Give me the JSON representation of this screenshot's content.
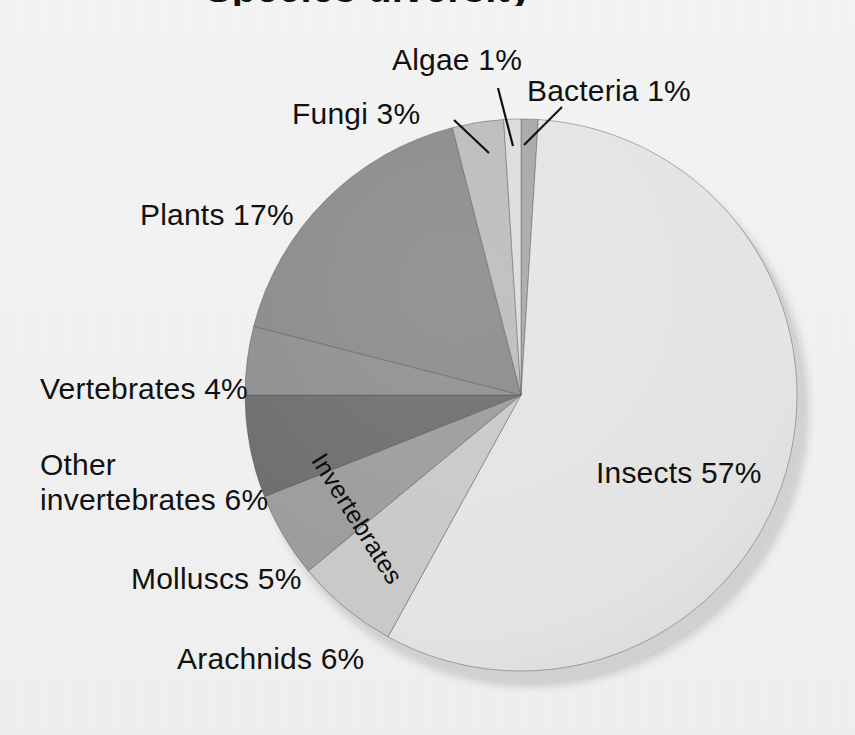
{
  "figure": {
    "kind": "pie-chart-scan",
    "background_color": "#f2f2f2",
    "text_color": "#111111",
    "cropped_title": "Species diversity",
    "center_x": 521,
    "center_y": 395,
    "radius": 276,
    "inner_bracket_label": "Invertebrates"
  },
  "chart_data": {
    "type": "pie",
    "title": "Species diversity",
    "xlabel": "",
    "ylabel": "",
    "units": "percent",
    "start_angle_deg": 0,
    "direction": "clockwise",
    "legend": "none (direct labels with leader lines)",
    "categories": [
      "Bacteria",
      "Insects",
      "Arachnids",
      "Molluscs",
      "Other invertebrates",
      "Vertebrates",
      "Plants",
      "Fungi",
      "Algae"
    ],
    "values": [
      1,
      57,
      6,
      5,
      6,
      4,
      17,
      3,
      1
    ],
    "slices": [
      {
        "name": "Bacteria",
        "label": "Bacteria 1%",
        "value": 1,
        "color": "#a8a8a8",
        "start_deg": 0,
        "end_deg": 3.6,
        "has_leader_line": true
      },
      {
        "name": "Insects",
        "label": "Insects  57%",
        "value": 57,
        "color": "#e4e4e4",
        "start_deg": 3.6,
        "end_deg": 208.8,
        "has_leader_line": false
      },
      {
        "name": "Arachnids",
        "label": "Arachnids 6%",
        "value": 6,
        "color": "#c9c9c9",
        "start_deg": 208.8,
        "end_deg": 230.4,
        "has_leader_line": false
      },
      {
        "name": "Molluscs",
        "label": "Molluscs 5%",
        "value": 5,
        "color": "#9d9d9d",
        "start_deg": 230.4,
        "end_deg": 248.4,
        "has_leader_line": false
      },
      {
        "name": "Other invertebrates",
        "label": "Other\ninvertebrates 6%",
        "value": 6,
        "color": "#6f6f6f",
        "start_deg": 248.4,
        "end_deg": 270.0,
        "has_leader_line": false
      },
      {
        "name": "Vertebrates",
        "label": "Vertebrates  4%",
        "value": 4,
        "color": "#909090",
        "start_deg": 270.0,
        "end_deg": 284.4,
        "has_leader_line": false
      },
      {
        "name": "Plants",
        "label": "Plants 17%",
        "value": 17,
        "color": "#8b8b8b",
        "start_deg": 284.4,
        "end_deg": 345.6,
        "has_leader_line": false
      },
      {
        "name": "Fungi",
        "label": "Fungi 3%",
        "value": 3,
        "color": "#bcbcbc",
        "start_deg": 345.6,
        "end_deg": 356.4,
        "has_leader_line": true
      },
      {
        "name": "Algae",
        "label": "Algae 1%",
        "value": 1,
        "color": "#dcdcdc",
        "start_deg": 356.4,
        "end_deg": 360.0,
        "has_leader_line": true
      }
    ]
  },
  "labels": {
    "algae": "Algae 1%",
    "bacteria": "Bacteria 1%",
    "fungi": "Fungi 3%",
    "plants": "Plants 17%",
    "vertebrates": "Vertebrates  4%",
    "other_invertebrates": "Other\ninvertebrates 6%",
    "molluscs": "Molluscs 5%",
    "arachnids": "Arachnids 6%",
    "insects": "Insects  57%",
    "invertebrates_bracket": "Invertebrates"
  }
}
